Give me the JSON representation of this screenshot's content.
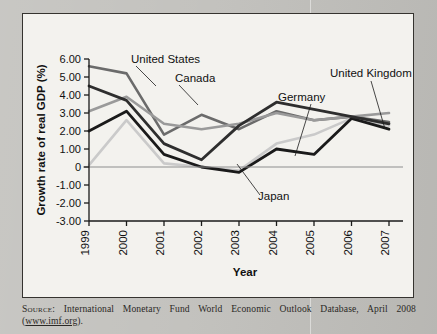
{
  "figure": {
    "background_color": "#f3f2ee",
    "border_color": "#35332f"
  },
  "source": {
    "label": "Source:",
    "text": " International Monetary Fund World Economic Outlook Database, April 2008 (",
    "link": "www.imf.org",
    "tail": ")."
  },
  "chart_data": {
    "type": "line",
    "title": "",
    "xlabel": "Year",
    "ylabel": "Growth rate of real GDP (%)",
    "x": [
      "1999",
      "2000",
      "2001",
      "2002",
      "2003",
      "2004",
      "2005",
      "2006",
      "2007"
    ],
    "xtick_labels": [
      "1999",
      "2000",
      "2001",
      "2002",
      "2003",
      "2004",
      "2005",
      "2006",
      "2007"
    ],
    "ytick_labels": [
      "6.00",
      "5.00",
      "4.00",
      "3.00",
      "2.00",
      "1.00",
      "0",
      "-1.00",
      "-2.00",
      "-3.00"
    ],
    "ytick_values": [
      6,
      5,
      4,
      3,
      2,
      1,
      0,
      -1,
      -2,
      -3
    ],
    "ylim": [
      -3,
      6
    ],
    "grid": false,
    "legend": "annotations",
    "zero_line": true,
    "series": [
      {
        "name": "United States",
        "color": "#6b6b6b",
        "width": 2.6,
        "values": [
          5.6,
          5.2,
          1.8,
          2.9,
          2.1,
          3.1,
          2.6,
          2.8,
          2.5
        ]
      },
      {
        "name": "Canada",
        "color": "#9a9a9a",
        "width": 2.6,
        "values": [
          3.1,
          3.9,
          2.4,
          2.1,
          2.4,
          3.0,
          2.6,
          2.8,
          3.0
        ]
      },
      {
        "name": "Germany",
        "color": "#cacaca",
        "width": 2.6,
        "values": [
          0.1,
          2.6,
          0.2,
          0.0,
          -0.2,
          1.3,
          1.8,
          2.7,
          2.3
        ]
      },
      {
        "name": "Japan",
        "color": "#1a1a1a",
        "width": 2.8,
        "values": [
          2.0,
          3.1,
          0.7,
          0.0,
          -0.3,
          1.0,
          0.7,
          2.7,
          2.1
        ]
      },
      {
        "name": "United Kingdom",
        "color": "#2e2e2e",
        "width": 2.8,
        "values": [
          4.5,
          3.7,
          1.3,
          0.4,
          2.3,
          3.6,
          3.2,
          2.8,
          2.4
        ]
      }
    ],
    "annotations": [
      {
        "name": "United States",
        "text_x": 108,
        "text_y": 49,
        "anchor": "start",
        "leader": [
          [
            113,
            52
          ],
          [
            133,
            72
          ]
        ]
      },
      {
        "name": "Canada",
        "text_x": 152,
        "text_y": 68,
        "anchor": "start",
        "leader": [
          [
            156,
            71
          ],
          [
            175,
            91
          ]
        ]
      },
      {
        "name": "Germany",
        "text_x": 255,
        "text_y": 87,
        "anchor": "start",
        "leader": [
          [
            288,
            90
          ],
          [
            272,
            142
          ]
        ]
      },
      {
        "name": "Japan",
        "text_x": 235,
        "text_y": 186,
        "anchor": "start",
        "leader": [
          [
            237,
            181
          ],
          [
            214,
            150
          ]
        ]
      },
      {
        "name": "United Kingdom",
        "text_x": 307,
        "text_y": 63,
        "anchor": "start",
        "leader": [
          [
            348,
            67
          ],
          [
            362,
            115
          ]
        ]
      }
    ]
  }
}
